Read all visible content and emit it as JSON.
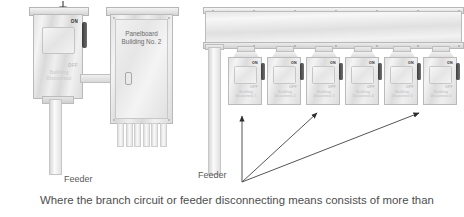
{
  "watermark": {
    "text": "© NFPA/IAEI 2007"
  },
  "left_assembly": {
    "disconnect": {
      "on_label": "ON",
      "off_label": "OFF",
      "nameplate_line1": "Building",
      "nameplate_line2": "Disconnect"
    },
    "feeder_label": "Feeder"
  },
  "panelboard": {
    "title_line1": "Panelboard",
    "title_line2": "Building No. 2",
    "stub_count": 6,
    "latch_name": "door-latch"
  },
  "right_assembly": {
    "wireway_name": "auxiliary-gutter",
    "feeder_label": "Feeder",
    "disconnects": [
      {
        "on_label": "ON",
        "off_label": "OFF",
        "nameplate_line1": "Building",
        "nameplate_line2": "Disconnect 1"
      },
      {
        "on_label": "ON",
        "off_label": "OFF",
        "nameplate_line1": "Building",
        "nameplate_line2": "Disconnect 2"
      },
      {
        "on_label": "ON",
        "off_label": "OFF",
        "nameplate_line1": "Building",
        "nameplate_line2": "Disconnect 3"
      },
      {
        "on_label": "ON",
        "off_label": "OFF",
        "nameplate_line1": "Building",
        "nameplate_line2": "Disconnect 4"
      },
      {
        "on_label": "ON",
        "off_label": "OFF",
        "nameplate_line1": "Building",
        "nameplate_line2": "Disconnect 5"
      },
      {
        "on_label": "ON",
        "off_label": "OFF",
        "nameplate_line1": "Building",
        "nameplate_line2": "Disconnect 6"
      }
    ]
  },
  "caption": {
    "text": "Where the branch circuit or feeder disconnecting means consists of more than"
  },
  "colors": {
    "line": "#555555",
    "text": "#4d4d4d",
    "metal_light": "#f4f4f4",
    "metal_dark": "#d9d9d9",
    "handle": "#3d3d3d"
  }
}
